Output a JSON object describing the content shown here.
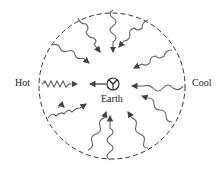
{
  "labels": {
    "left": "Hot",
    "right": "Cool",
    "center": "Earth"
  },
  "diagram": {
    "boundary": "dashed-circle",
    "center_symbol": "earth-symbol",
    "arrow_count": 14,
    "colors": {
      "stroke": "#555555",
      "arrow": "#333333"
    }
  }
}
